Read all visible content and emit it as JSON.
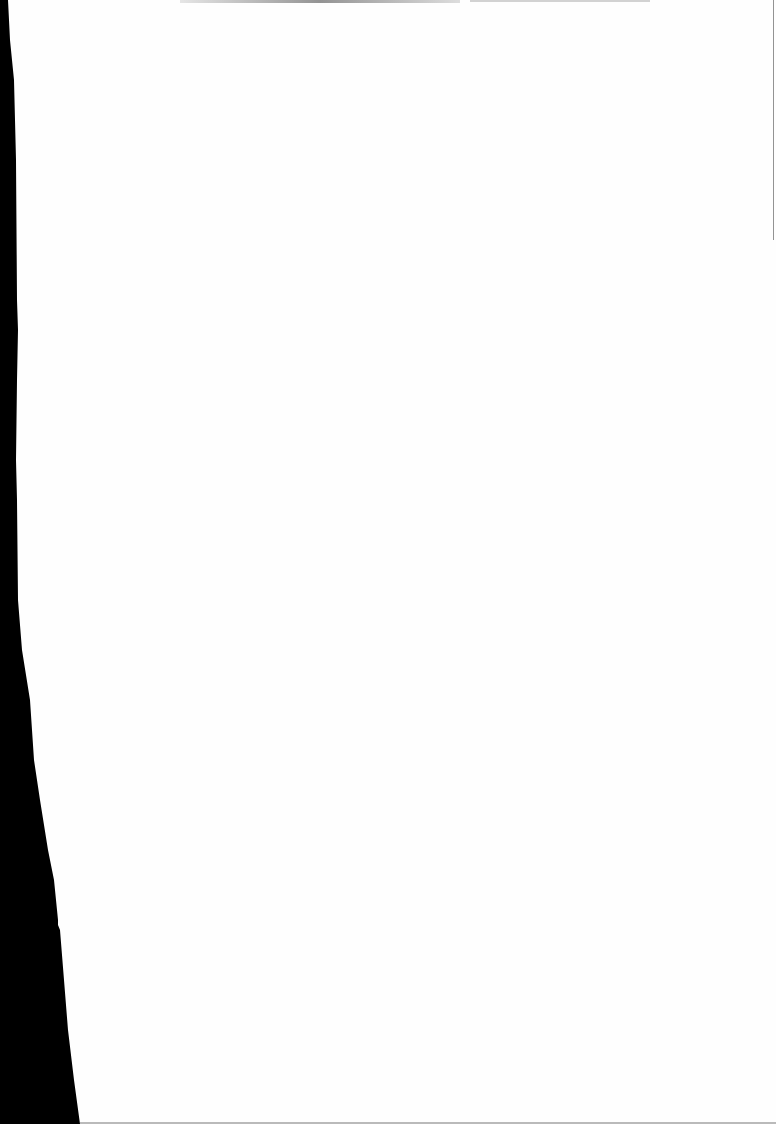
{
  "document": {
    "type": "blank scanned page",
    "background_color": "#fefefe",
    "scan_edge_color": "#000000",
    "visible_text": [],
    "bleed_through_text_legible": false
  }
}
